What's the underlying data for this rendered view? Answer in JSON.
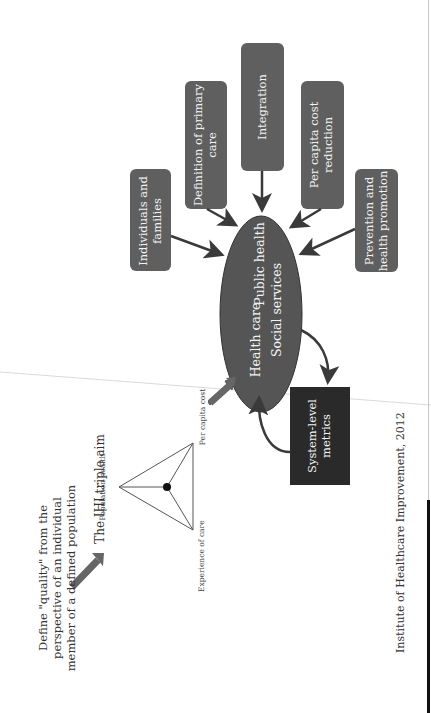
{
  "diagram": {
    "orientation": "rotated-90-ccw",
    "colors": {
      "box_fill": "#5f5f5f",
      "ellipse_fill": "#555555",
      "metrics_fill": "#2a2a2a",
      "arrow": "#3a3a3a",
      "big_arrow": "#666666",
      "text_light": "#f2f2f2",
      "text_dark": "#333333"
    },
    "intro": {
      "definition_lines": [
        "Define \"quality\" from the",
        "perspective of an individual",
        "member of a defined population"
      ]
    },
    "triple_aim": {
      "title": "The IHI triple aim",
      "vertices": {
        "top": "Population health",
        "bottom_left": "Experience of care",
        "bottom_right": "Per capita cost"
      }
    },
    "center": {
      "labels": [
        "Health care",
        "Public health",
        "Social services"
      ]
    },
    "inputs": [
      {
        "id": "individuals",
        "lines": [
          "Individuals and",
          "families"
        ]
      },
      {
        "id": "primary-care",
        "lines": [
          "Definition of primary",
          "care"
        ]
      },
      {
        "id": "integration",
        "lines": [
          "Integration"
        ]
      },
      {
        "id": "cost-reduction",
        "lines": [
          "Per capita cost",
          "reduction"
        ]
      },
      {
        "id": "prevention",
        "lines": [
          "Prevention and",
          "health promotion"
        ]
      }
    ],
    "metrics": {
      "lines": [
        "System-level",
        "metrics"
      ]
    },
    "citation": "Institute of Healthcare Improvement, 2012"
  }
}
